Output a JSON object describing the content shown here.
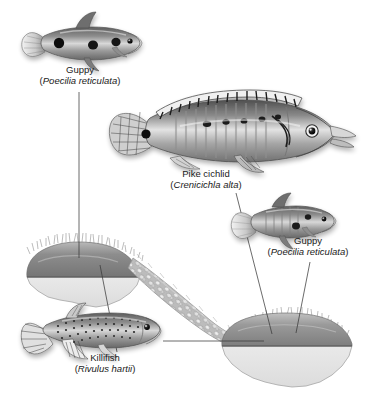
{
  "figure": {
    "type": "biology-diagram",
    "background_color": "#ffffff",
    "ink_color": "#1a1a1a",
    "width": 368,
    "height": 404
  },
  "labels": [
    {
      "id": "guppy-upstream",
      "common": "Guppy",
      "sci_open": "(",
      "sci": "Poecilia reticulata",
      "sci_close": ")"
    },
    {
      "id": "pike-cichlid",
      "common": "Pike cichlid",
      "sci_open": "(",
      "sci": "Crenicichla alta",
      "sci_close": ")"
    },
    {
      "id": "guppy-downstream",
      "common": "Guppy",
      "sci_open": "(",
      "sci": "Poecilia reticulata",
      "sci_close": ")"
    },
    {
      "id": "killifish",
      "common": "Killifish",
      "sci_open": "(",
      "sci": "Rivulus hartii",
      "sci_close": ")"
    }
  ],
  "scene": {
    "pools": [
      {
        "id": "upstream-pool",
        "position": "upper-left",
        "water_color": "#8d8d8d",
        "cutaway_color": "#e2e2e2"
      },
      {
        "id": "downstream-pool",
        "position": "lower-right",
        "water_color": "#9a9a9a",
        "cutaway_color": "#e4e4e4"
      }
    ],
    "stream": {
      "id": "connecting-stream",
      "texture": "cobbled-rocks",
      "color": "#b6b6b6"
    },
    "fishes": [
      {
        "id": "guppy-upstream-illustration",
        "facing": "right",
        "body_color": "#8f8f8f"
      },
      {
        "id": "pike-cichlid-illustration",
        "facing": "right",
        "body_color": "#9d9d9d"
      },
      {
        "id": "guppy-downstream-illustration",
        "facing": "right",
        "body_color": "#989898"
      },
      {
        "id": "killifish-illustration",
        "facing": "right",
        "body_color": "#909090"
      }
    ],
    "leader_lines": [
      {
        "id": "leader-guppy-upstream-to-pool",
        "from": "guppy-upstream-label",
        "to": "upstream-pool"
      },
      {
        "id": "leader-killifish-to-pool",
        "from": "killifish-label",
        "to": "upstream-pool"
      },
      {
        "id": "leader-killifish-to-downstream-pool",
        "from": "killifish-label",
        "to": "downstream-pool"
      },
      {
        "id": "leader-pike-cichlid-to-pool",
        "from": "pike-cichlid-label",
        "to": "downstream-pool"
      },
      {
        "id": "leader-guppy-downstream-to-pool",
        "from": "guppy-downstream-label",
        "to": "downstream-pool"
      }
    ]
  }
}
